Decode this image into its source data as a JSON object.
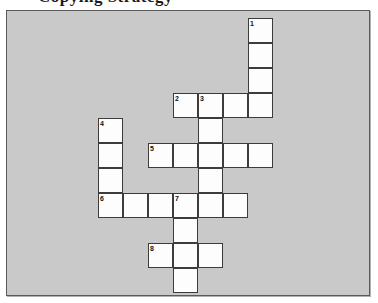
{
  "page": {
    "title_fragment": "Copying Strategy",
    "background_color": "#ffffff"
  },
  "puzzle": {
    "type": "crossword-grid",
    "panel_background": "#c9c9c9",
    "cell_background": "#fdfdfd",
    "cell_border_color": "#3c3c3c",
    "frame_border_color": "#5a5a5a",
    "cell_size_px": 25,
    "origin": {
      "x": 91,
      "y": 7
    },
    "grid_columns": 7,
    "grid_rows": 11,
    "entries": [
      {
        "number": "1",
        "direction": "down",
        "col": 6,
        "row": 0,
        "length": 4
      },
      {
        "number": "2",
        "direction": "across",
        "col": 3,
        "row": 3,
        "length": 4
      },
      {
        "number": "3",
        "direction": "down",
        "col": 4,
        "row": 3,
        "length": 5
      },
      {
        "number": "4",
        "direction": "down",
        "col": 0,
        "row": 4,
        "length": 4
      },
      {
        "number": "5",
        "direction": "across",
        "col": 2,
        "row": 5,
        "length": 5
      },
      {
        "number": "6",
        "direction": "across",
        "col": 0,
        "row": 7,
        "length": 6
      },
      {
        "number": "7",
        "direction": "down",
        "col": 3,
        "row": 7,
        "length": 4
      },
      {
        "number": "8",
        "direction": "across",
        "col": 2,
        "row": 9,
        "length": 3
      }
    ],
    "cells": [
      {
        "col": 6,
        "row": 0,
        "number": "1"
      },
      {
        "col": 6,
        "row": 1,
        "number": ""
      },
      {
        "col": 6,
        "row": 2,
        "number": ""
      },
      {
        "col": 3,
        "row": 3,
        "number": "2"
      },
      {
        "col": 4,
        "row": 3,
        "number": "3"
      },
      {
        "col": 5,
        "row": 3,
        "number": ""
      },
      {
        "col": 6,
        "row": 3,
        "number": ""
      },
      {
        "col": 0,
        "row": 4,
        "number": "4"
      },
      {
        "col": 4,
        "row": 4,
        "number": ""
      },
      {
        "col": 0,
        "row": 5,
        "number": ""
      },
      {
        "col": 2,
        "row": 5,
        "number": "5"
      },
      {
        "col": 3,
        "row": 5,
        "number": ""
      },
      {
        "col": 4,
        "row": 5,
        "number": ""
      },
      {
        "col": 5,
        "row": 5,
        "number": ""
      },
      {
        "col": 6,
        "row": 5,
        "number": ""
      },
      {
        "col": 0,
        "row": 6,
        "number": ""
      },
      {
        "col": 4,
        "row": 6,
        "number": ""
      },
      {
        "col": 0,
        "row": 7,
        "number": "6"
      },
      {
        "col": 1,
        "row": 7,
        "number": ""
      },
      {
        "col": 2,
        "row": 7,
        "number": ""
      },
      {
        "col": 3,
        "row": 7,
        "number": "7"
      },
      {
        "col": 4,
        "row": 7,
        "number": ""
      },
      {
        "col": 5,
        "row": 7,
        "number": ""
      },
      {
        "col": 3,
        "row": 8,
        "number": ""
      },
      {
        "col": 2,
        "row": 9,
        "number": "8"
      },
      {
        "col": 3,
        "row": 9,
        "number": ""
      },
      {
        "col": 4,
        "row": 9,
        "number": ""
      },
      {
        "col": 3,
        "row": 10,
        "number": ""
      }
    ]
  }
}
